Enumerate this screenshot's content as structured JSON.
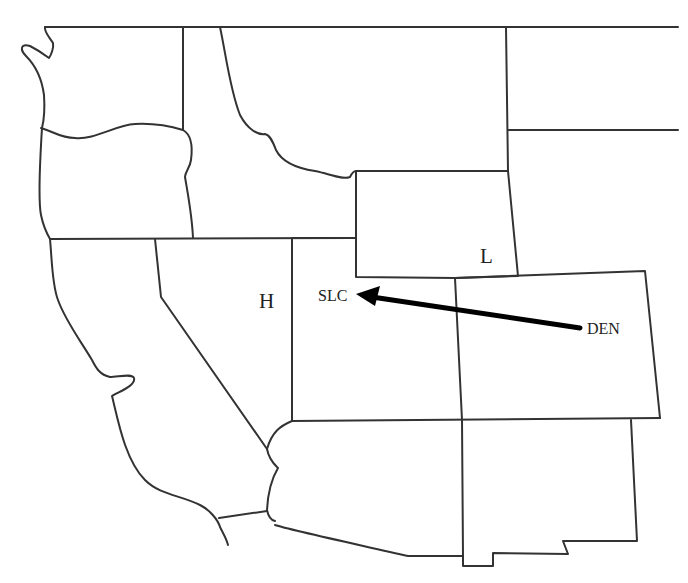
{
  "map": {
    "type": "western-us-state-outline",
    "background_color": "#ffffff",
    "line_color": "#333333",
    "arrow_color": "#000000"
  },
  "labels": {
    "high_pressure": "H",
    "low_pressure": "L",
    "origin_city": "DEN",
    "destination_city": "SLC"
  },
  "arrow": {
    "from": "DEN",
    "to": "SLC",
    "icon": "arrow-left-icon"
  }
}
